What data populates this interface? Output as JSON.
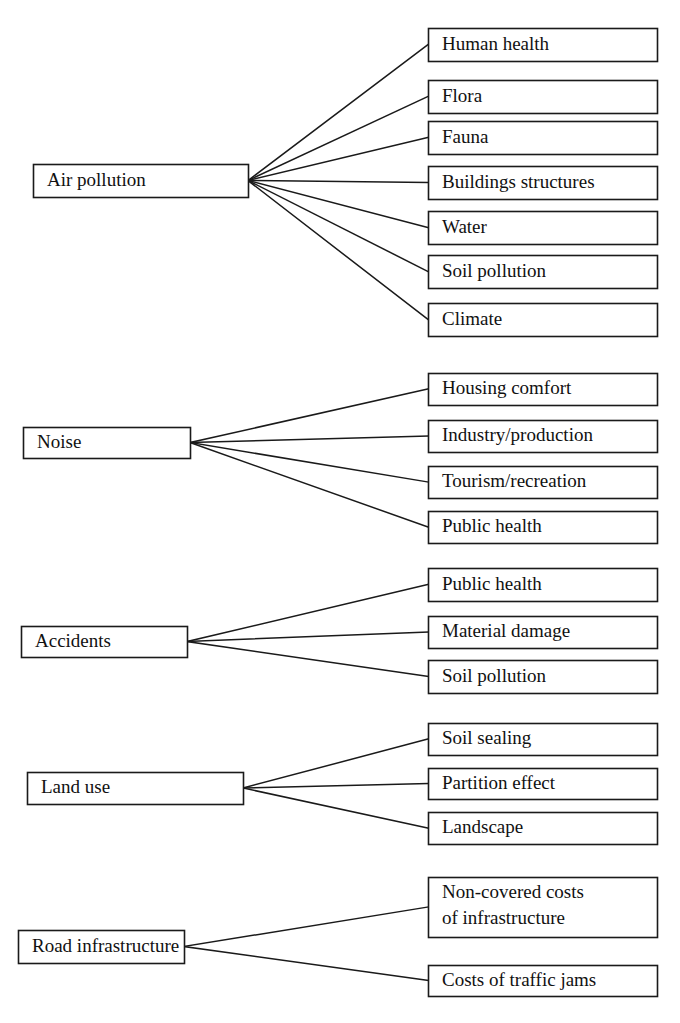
{
  "diagram": {
    "type": "tree-fan",
    "title": "",
    "style": {
      "box_fill": "#ffffff",
      "box_border": "#1a1a1a",
      "connector_color": "#1a1a1a",
      "text_color": "#111111",
      "background": "#ffffff"
    },
    "groups": [
      {
        "id": "air-pollution",
        "root": {
          "label": "Air pollution",
          "x": 33,
          "y": 164,
          "w": 215,
          "h": 33
        },
        "children": [
          {
            "label": "Human health",
            "x": 428,
            "y": 28,
            "w": 229,
            "h": 33
          },
          {
            "label": "Flora",
            "x": 428,
            "y": 80,
            "w": 229,
            "h": 33
          },
          {
            "label": "Fauna",
            "x": 428,
            "y": 121,
            "w": 229,
            "h": 33
          },
          {
            "label": "Buildings structures",
            "x": 428,
            "y": 166,
            "w": 229,
            "h": 33
          },
          {
            "label": "Water",
            "x": 428,
            "y": 211,
            "w": 229,
            "h": 33
          },
          {
            "label": "Soil pollution",
            "x": 428,
            "y": 255,
            "w": 229,
            "h": 33
          },
          {
            "label": "Climate",
            "x": 428,
            "y": 303,
            "w": 229,
            "h": 33
          }
        ]
      },
      {
        "id": "noise",
        "root": {
          "label": "Noise",
          "x": 23,
          "y": 427,
          "w": 167,
          "h": 31
        },
        "children": [
          {
            "label": "Housing comfort",
            "x": 428,
            "y": 373,
            "w": 229,
            "h": 32
          },
          {
            "label": "Industry/production",
            "x": 428,
            "y": 420,
            "w": 229,
            "h": 32
          },
          {
            "label": "Tourism/recreation",
            "x": 428,
            "y": 466,
            "w": 229,
            "h": 32
          },
          {
            "label": "Public health",
            "x": 428,
            "y": 511,
            "w": 229,
            "h": 32
          }
        ]
      },
      {
        "id": "accidents",
        "root": {
          "label": "Accidents",
          "x": 21,
          "y": 626,
          "w": 166,
          "h": 31
        },
        "children": [
          {
            "label": "Public health",
            "x": 428,
            "y": 568,
            "w": 229,
            "h": 33
          },
          {
            "label": "Material damage",
            "x": 428,
            "y": 616,
            "w": 229,
            "h": 32
          },
          {
            "label": "Soil pollution",
            "x": 428,
            "y": 660,
            "w": 229,
            "h": 33
          }
        ]
      },
      {
        "id": "land-use",
        "root": {
          "label": "Land use",
          "x": 27,
          "y": 772,
          "w": 216,
          "h": 32
        },
        "children": [
          {
            "label": "Soil sealing",
            "x": 428,
            "y": 723,
            "w": 229,
            "h": 32
          },
          {
            "label": "Partition effect",
            "x": 428,
            "y": 768,
            "w": 229,
            "h": 31
          },
          {
            "label": "Landscape",
            "x": 428,
            "y": 812,
            "w": 229,
            "h": 32
          }
        ]
      },
      {
        "id": "road-infrastructure",
        "root": {
          "label": "Road infrastructure",
          "x": 18,
          "y": 930,
          "w": 166,
          "h": 33
        },
        "children": [
          {
            "label": "Non-covered costs of infrastructure",
            "lines": [
              "Non-covered costs",
              "of infrastructure"
            ],
            "x": 428,
            "y": 877,
            "w": 229,
            "h": 60
          },
          {
            "label": "Costs of traffic jams",
            "x": 428,
            "y": 965,
            "w": 229,
            "h": 31
          }
        ]
      }
    ]
  }
}
